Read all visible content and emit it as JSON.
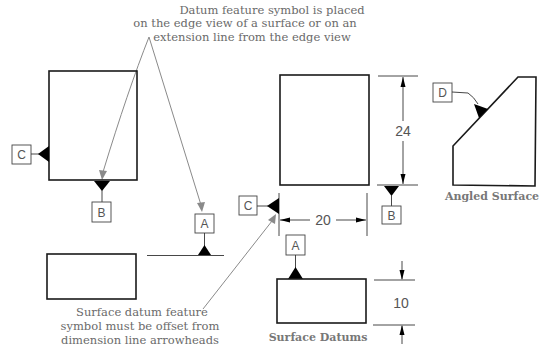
{
  "top_cut_text": "Datum feature symbol is placed",
  "callouts": {
    "top": {
      "lines": [
        "Datum feature symbol is placed",
        "on the edge view of a surface or on an",
        "extension line from the edge view"
      ]
    },
    "bottom": {
      "lines": [
        "Surface datum feature",
        "symbol must be offset from",
        "dimension line arrowheads"
      ]
    }
  },
  "datum_labels": {
    "left_c": "C",
    "left_b": "B",
    "left_a": "A",
    "mid_c": "C",
    "mid_b": "B",
    "mid_a": "A",
    "angled_d": "D"
  },
  "dimensions": {
    "height": "24",
    "width": "20",
    "thickness": "10"
  },
  "captions": {
    "surface": "Surface Datums",
    "angled": "Angled Surface"
  },
  "colors": {
    "text": "#6a6a6a",
    "leader": "#8a8a8a",
    "outline": "#1a1a1a",
    "symbol": "#000000"
  }
}
